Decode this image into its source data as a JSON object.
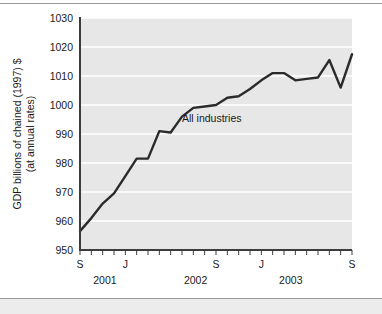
{
  "figure": {
    "background_color": "#ffffff",
    "plot_background_color": "#e7e7e7",
    "gridline_color": "#ffffff",
    "axis_color": "#3c3c3c",
    "series_color": "#2b2b2b",
    "rule_color": "#9a9a9a",
    "footer_band_color": "#ececec"
  },
  "chart_data": {
    "type": "line",
    "title": "",
    "subtitle": "",
    "xlabel": "",
    "ylabel": "GDP billions of chained (1997) $ (at annual rates)",
    "ylabel_line1": "GDP billions of chained (1997) $",
    "ylabel_line2": "(at annual rates)",
    "ylim": [
      950,
      1030
    ],
    "ytick_values": [
      950,
      960,
      970,
      980,
      990,
      1000,
      1010,
      1020,
      1030
    ],
    "ytick_labels": [
      "950",
      "960",
      "970",
      "980",
      "990",
      "1000",
      "1010",
      "1020",
      "1030"
    ],
    "grid": true,
    "grid_axis": "y",
    "legend": false,
    "legend_position": "none",
    "xtick_count": 25,
    "xtick_labels": [
      "S",
      "",
      "",
      "",
      "J",
      "",
      "",
      "",
      "",
      "",
      "",
      "",
      "S",
      "",
      "",
      "",
      "J",
      "",
      "",
      "",
      "",
      "",
      "",
      "",
      "S"
    ],
    "xtick_labeled": [
      {
        "index": 0,
        "label": "S"
      },
      {
        "index": 4,
        "label": "J"
      },
      {
        "index": 12,
        "label": "S"
      },
      {
        "index": 16,
        "label": "J"
      },
      {
        "index": 24,
        "label": "S"
      }
    ],
    "year_labels": [
      {
        "label": "2001",
        "index": 2.2
      },
      {
        "label": "2002",
        "index": 10.2
      },
      {
        "label": "2003",
        "index": 18.6
      }
    ],
    "x": [
      "2001-09",
      "2001-10",
      "2001-11",
      "2001-12",
      "2002-01",
      "2002-02",
      "2002-03",
      "2002-04",
      "2002-05",
      "2002-06",
      "2002-07",
      "2002-08",
      "2002-09",
      "2002-10",
      "2002-11",
      "2002-12",
      "2003-01",
      "2003-02",
      "2003-03",
      "2003-04",
      "2003-05",
      "2003-06",
      "2003-07",
      "2003-08",
      "2003-09"
    ],
    "series": [
      {
        "name": "All industries",
        "color": "#2b2b2b",
        "label_text": "All industries",
        "values": [
          956.5,
          961.0,
          966.0,
          969.5,
          975.5,
          981.5,
          981.5,
          991.0,
          990.5,
          996.0,
          999.0,
          999.5,
          1000.0,
          1002.5,
          1003.0,
          1005.5,
          1008.5,
          1011.0,
          1011.0,
          1008.5,
          1009.0,
          1009.5,
          1015.5,
          1006.0,
          1017.5
        ]
      }
    ],
    "annotations": [
      {
        "text": "All industries",
        "x_index": 9.0,
        "y_value": 994.0
      }
    ]
  }
}
